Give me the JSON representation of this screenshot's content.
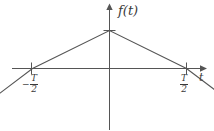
{
  "chart_data": {
    "type": "line",
    "title": "",
    "xlabel": "t",
    "ylabel": "f(t)",
    "x": [
      -1,
      0,
      1
    ],
    "values": [
      0,
      1,
      0
    ],
    "series": [
      {
        "name": "f(t)",
        "points": [
          {
            "x": -1.45,
            "y": -0.69
          },
          {
            "x": -1.0,
            "y": 0.0
          },
          {
            "x": 0.0,
            "y": 1.0
          },
          {
            "x": 1.0,
            "y": 0.0
          },
          {
            "x": 1.45,
            "y": -0.69
          }
        ]
      }
    ],
    "xticks": [
      -1,
      1
    ],
    "xticklabels": [
      "-T/2",
      "T/2"
    ],
    "yticks": [
      1
    ],
    "yticklabels": [
      ""
    ],
    "xlim": [
      -1.9,
      1.65
    ],
    "ylim": [
      -0.85,
      1.4
    ],
    "grid": false,
    "legend": false
  },
  "labels": {
    "y_axis": "f(t)",
    "x_axis": "t",
    "tick_left_sign": "−",
    "tick_left_numerator": "T",
    "tick_left_denominator": "2",
    "tick_right_numerator": "T",
    "tick_right_denominator": "2"
  },
  "style": {
    "line_color": "#555555",
    "axis_color": "#555555",
    "text_color": "#3a3a3a",
    "background": "#ffffff"
  }
}
